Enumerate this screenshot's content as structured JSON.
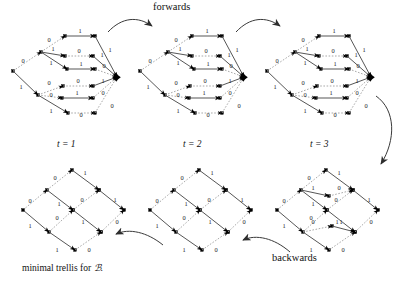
{
  "figure": {
    "title_top": "forwards",
    "title_bottom": "backwards",
    "caption": "minimal trellis for ℬ.",
    "caption_prefix": "minimal trellis for",
    "caption_symbol": "ℬ",
    "caption_suffix": ".",
    "stage_labels": [
      "t = 1",
      "t = 2",
      "t = 3"
    ],
    "edge_label_zero": "0",
    "edge_label_one": "1",
    "colors": {
      "edge_solid": "#4d4d4d",
      "edge_dashed": "#9a9a9a",
      "node": "#000000",
      "text": "#1a1a1a",
      "arrow": "#3a3a3a",
      "background": "#ffffff"
    }
  },
  "panels": [
    {
      "id": "top-1",
      "name": "trellis-top-1",
      "stage": "t = 1",
      "position": "top-left",
      "nodes": 17,
      "description": "expanded trellis, left root fanning right into single merge node"
    },
    {
      "id": "top-2",
      "name": "trellis-top-2",
      "stage": "t = 2",
      "position": "top-middle",
      "nodes": 17,
      "description": "expanded trellis, left root fanning right into single merge node"
    },
    {
      "id": "top-3",
      "name": "trellis-top-3",
      "stage": "t = 3",
      "position": "top-right",
      "nodes": 17,
      "description": "expanded trellis, left root fanning right into single merge node"
    },
    {
      "id": "bottom-3",
      "name": "trellis-bottom-3",
      "stage": "t = 3",
      "position": "bottom-right",
      "nodes": 14,
      "description": "partially merged diamond trellis"
    },
    {
      "id": "bottom-2",
      "name": "trellis-bottom-2",
      "stage": "t = 2",
      "position": "bottom-middle",
      "nodes": 12,
      "description": "minimal diamond trellis"
    },
    {
      "id": "bottom-1",
      "name": "trellis-bottom-1",
      "stage": "t = 1",
      "position": "bottom-left",
      "nodes": 12,
      "description": "minimal diamond trellis"
    }
  ],
  "arrows": [
    {
      "name": "arrow-forwards-1",
      "from": "top-1",
      "to": "top-2",
      "direction": "right"
    },
    {
      "name": "arrow-forwards-2",
      "from": "top-2",
      "to": "top-3",
      "direction": "right"
    },
    {
      "name": "arrow-turn-down",
      "from": "top-3",
      "to": "bottom-3",
      "direction": "down"
    },
    {
      "name": "arrow-backwards-1",
      "from": "bottom-3",
      "to": "bottom-2",
      "direction": "left"
    },
    {
      "name": "arrow-backwards-2",
      "from": "bottom-2",
      "to": "bottom-1",
      "direction": "left"
    }
  ]
}
